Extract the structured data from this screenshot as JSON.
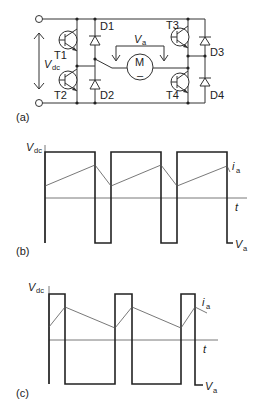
{
  "figure": {
    "panel_a": {
      "label": "(a)",
      "supply_label": "V",
      "supply_sub": "dc",
      "armature_label": "V",
      "armature_sub": "a",
      "motor_label": "M",
      "motor_sign": "–",
      "transistors": [
        "T1",
        "T2",
        "T3",
        "T4"
      ],
      "diodes": [
        "D1",
        "D2",
        "D3",
        "D4"
      ]
    },
    "panel_b": {
      "label": "(b)",
      "y_label": "V",
      "y_sub": "dc",
      "current_label": "i",
      "current_sub": "a",
      "time_label": "t",
      "voltage_label": "V",
      "voltage_sub": "a"
    },
    "panel_c": {
      "label": "(c)",
      "y_label": "V",
      "y_sub": "dc",
      "current_label": "i",
      "current_sub": "a",
      "time_label": "t",
      "voltage_label": "V",
      "voltage_sub": "a"
    }
  },
  "colors": {
    "line": "#222222",
    "background": "#ffffff"
  }
}
